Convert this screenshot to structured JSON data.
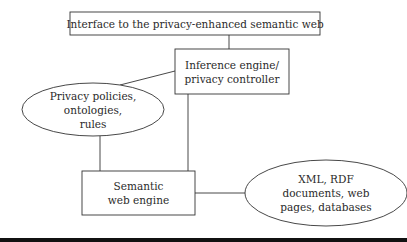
{
  "diagram": {
    "nodes": [
      {
        "id": "interface",
        "shape": "rect",
        "lines": [
          "Interface to the privacy-enhanced semantic web"
        ]
      },
      {
        "id": "inference",
        "shape": "rect",
        "lines": [
          "Inference engine/",
          "privacy controller"
        ]
      },
      {
        "id": "policies",
        "shape": "ellipse",
        "lines": [
          "Privacy policies,",
          "ontologies,",
          "rules"
        ]
      },
      {
        "id": "semantic",
        "shape": "rect",
        "lines": [
          "Semantic",
          "web engine"
        ]
      },
      {
        "id": "sources",
        "shape": "ellipse",
        "lines": [
          "XML, RDF",
          "documents, web",
          "pages, databases"
        ]
      }
    ],
    "edges": [
      {
        "from": "interface",
        "to": "inference"
      },
      {
        "from": "inference",
        "to": "policies"
      },
      {
        "from": "inference",
        "to": "semantic"
      },
      {
        "from": "policies",
        "to": "semantic"
      },
      {
        "from": "semantic",
        "to": "sources"
      }
    ],
    "colors": {
      "stroke": "#333333",
      "text": "#2a2a2a",
      "background": "#ffffff",
      "bottom_bar": "#111111"
    }
  }
}
